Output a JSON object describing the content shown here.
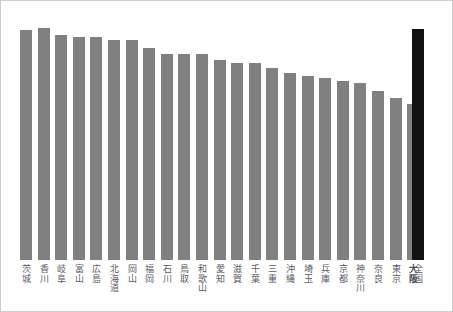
{
  "chart_data": {
    "type": "bar",
    "title": "",
    "subtitle": "",
    "xlabel": "",
    "ylabel": "",
    "grid": false,
    "legend": null,
    "ylim": [
      0,
      100
    ],
    "categories": [
      "茨城",
      "香川",
      "岐阜",
      "富山",
      "広島",
      "北海道",
      "岡山",
      "福岡",
      "石川",
      "鳥取",
      "和歌山",
      "愛知",
      "滋賀",
      "千葉",
      "三重",
      "沖縄",
      "埼玉",
      "兵庫",
      "京都",
      "神奈川",
      "奈良",
      "東京",
      "大阪",
      "全国"
    ],
    "values": [
      91.5,
      92.5,
      89.5,
      89.0,
      89.0,
      87.5,
      87.5,
      84.5,
      82.0,
      82.0,
      82.0,
      79.5,
      78.5,
      78.5,
      76.5,
      74.5,
      73.5,
      72.5,
      71.5,
      70.5,
      67.5,
      64.5,
      62.0,
      92.0
    ],
    "bar_colors": [
      "#808080",
      "#808080",
      "#808080",
      "#808080",
      "#808080",
      "#808080",
      "#808080",
      "#808080",
      "#808080",
      "#808080",
      "#808080",
      "#808080",
      "#808080",
      "#808080",
      "#808080",
      "#808080",
      "#808080",
      "#808080",
      "#808080",
      "#808080",
      "#808080",
      "#808080",
      "#808080",
      "#111111"
    ],
    "emphasis_labels": [
      "大阪"
    ],
    "total_category": "全国",
    "series": [
      {
        "name": "値",
        "values": [
          91.5,
          92.5,
          89.5,
          89.0,
          89.0,
          87.5,
          87.5,
          84.5,
          82.0,
          82.0,
          82.0,
          79.5,
          78.5,
          78.5,
          76.5,
          74.5,
          73.5,
          72.5,
          71.5,
          70.5,
          67.5,
          64.5,
          62.0,
          92.0
        ]
      }
    ]
  },
  "style": {
    "bar_color": "#808080",
    "total_bar_color": "#111111",
    "label_color": "#5a5a6a",
    "background": "#ffffff",
    "frame_color": "#cfcfcf"
  },
  "layout": {
    "bar_width_px": 12,
    "bar_pitch_px": 17.6,
    "first_bar_left_px": 19,
    "total_bar_left_px": 411,
    "plot_bottom_px": 259,
    "plot_top_px": 8
  }
}
